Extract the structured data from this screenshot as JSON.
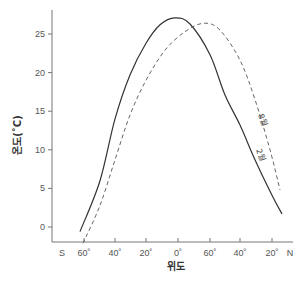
{
  "chart_data": {
    "type": "line",
    "title": "",
    "xlabel": "위도",
    "ylabel": "온도(˚C)",
    "ylim": [
      -2,
      28
    ],
    "yticks": [
      0,
      5,
      10,
      15,
      20,
      25
    ],
    "xtick_labels": [
      "S",
      "60˚",
      "40˚",
      "20˚",
      "0˚",
      "60˚",
      "40˚",
      "20˚",
      "N"
    ],
    "grid": false,
    "legend": "inline curve labels",
    "series": [
      {
        "name": "2월",
        "style": "solid",
        "color": "#333333",
        "points": [
          {
            "x_px": 80,
            "y": -0.6
          },
          {
            "x_px": 100,
            "y": 6.0
          },
          {
            "x_px": 115,
            "y": 14.0
          },
          {
            "x_px": 130,
            "y": 19.7
          },
          {
            "x_px": 146,
            "y": 23.8
          },
          {
            "x_px": 160,
            "y": 26.2
          },
          {
            "x_px": 175,
            "y": 27.1
          },
          {
            "x_px": 190,
            "y": 26.3
          },
          {
            "x_px": 210,
            "y": 22.3
          },
          {
            "x_px": 225,
            "y": 17.1
          },
          {
            "x_px": 240,
            "y": 13.2
          },
          {
            "x_px": 255,
            "y": 8.7
          },
          {
            "x_px": 272,
            "y": 4.1
          },
          {
            "x_px": 282,
            "y": 1.7
          }
        ]
      },
      {
        "name": "8월",
        "style": "dashed",
        "color": "#666666",
        "points": [
          {
            "x_px": 83,
            "y": -2.1
          },
          {
            "x_px": 100,
            "y": 2.8
          },
          {
            "x_px": 115,
            "y": 8.7
          },
          {
            "x_px": 130,
            "y": 14.5
          },
          {
            "x_px": 146,
            "y": 19.0
          },
          {
            "x_px": 165,
            "y": 22.9
          },
          {
            "x_px": 185,
            "y": 25.3
          },
          {
            "x_px": 204,
            "y": 26.4
          },
          {
            "x_px": 220,
            "y": 25.5
          },
          {
            "x_px": 240,
            "y": 21.6
          },
          {
            "x_px": 255,
            "y": 16.5
          },
          {
            "x_px": 270,
            "y": 10.0
          },
          {
            "x_px": 280,
            "y": 4.8
          }
        ]
      }
    ]
  },
  "labels": {
    "y_axis_title": "온도(˚C)",
    "x_axis_title": "위도",
    "curve_feb": "2월",
    "curve_aug": "8월"
  }
}
